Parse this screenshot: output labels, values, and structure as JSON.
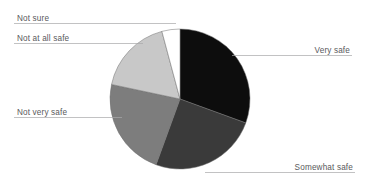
{
  "chart_data": {
    "type": "pie",
    "title": "",
    "subtitle": "",
    "xlabel": "",
    "ylabel": "",
    "legend_position": "none",
    "labels_position": "outside-with-leader-lines",
    "grid": false,
    "start_angle_deg": 0,
    "direction": "clockwise",
    "categories": [
      "Very safe",
      "Somewhat safe",
      "Not very safe",
      "Not at all safe",
      "Not sure"
    ],
    "values": [
      30.5,
      25.0,
      22.8,
      17.5,
      4.2
    ],
    "units": "percent",
    "colors": [
      "#0d0d0d",
      "#3a3a3a",
      "#7d7d7d",
      "#c8c8c8",
      "#ffffff"
    ],
    "slices": [
      {
        "label": "Very safe",
        "value": 30.5,
        "color": "#0d0d0d",
        "start_angle_deg": 0,
        "end_angle_deg": 110,
        "label_side": "right"
      },
      {
        "label": "Somewhat safe",
        "value": 25.0,
        "color": "#3a3a3a",
        "start_angle_deg": 110,
        "end_angle_deg": 200,
        "label_side": "right"
      },
      {
        "label": "Not very safe",
        "value": 22.8,
        "color": "#7d7d7d",
        "start_angle_deg": 200,
        "end_angle_deg": 282,
        "label_side": "left"
      },
      {
        "label": "Not at all safe",
        "value": 17.5,
        "color": "#c8c8c8",
        "start_angle_deg": 282,
        "end_angle_deg": 345,
        "label_side": "left"
      },
      {
        "label": "Not sure",
        "value": 4.2,
        "color": "#ffffff",
        "start_angle_deg": 345,
        "end_angle_deg": 360,
        "label_side": "left"
      }
    ]
  },
  "labels": {
    "not_sure": "Not sure",
    "not_at_all_safe": "Not at all safe",
    "not_very_safe": "Not very safe",
    "very_safe": "Very safe",
    "somewhat_safe": "Somewhat safe"
  },
  "style": {
    "background": "#ffffff",
    "label_color": "#59595c",
    "leader_line_color": "#a8a8aa",
    "slice_outline_color": "#6e6e6e"
  }
}
